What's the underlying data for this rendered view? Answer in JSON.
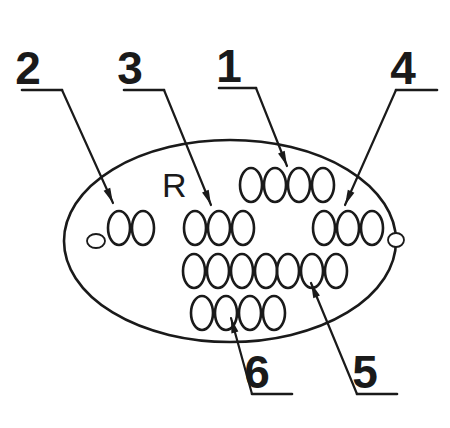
{
  "diagram": {
    "type": "line-drawing",
    "background_color": "#ffffff",
    "stroke_color": "#1a1a1a",
    "plate": {
      "shape": "ellipse",
      "cx": 230,
      "cy": 241,
      "rx": 166,
      "ry": 101,
      "stroke_width": 2.6,
      "mount_holes": [
        {
          "name": "left-mount-hole",
          "cx": 96,
          "cy": 241,
          "rx": 9,
          "ry": 7
        },
        {
          "name": "right-mount-hole",
          "cx": 396,
          "cy": 240,
          "rx": 8,
          "ry": 7
        }
      ]
    },
    "plate_letter": {
      "text": "R",
      "x": 162,
      "y": 197
    },
    "field_rows": [
      {
        "name": "row-1",
        "y": 185,
        "groups": [
          {
            "name": "row1-group-a",
            "chars": "0000",
            "x": 240
          }
        ]
      },
      {
        "name": "row-2",
        "y": 228,
        "groups": [
          {
            "name": "row2-group-a",
            "chars": "00",
            "x": 108
          },
          {
            "name": "row2-group-b",
            "chars": "000",
            "x": 184
          },
          {
            "name": "row2-group-c",
            "chars": "000",
            "x": 313
          }
        ]
      },
      {
        "name": "row-3",
        "y": 271,
        "groups": [
          {
            "name": "row3-group-a",
            "chars": "0000",
            "x": 183
          },
          {
            "name": "row3-group-b",
            "chars": "000",
            "x": 277
          }
        ]
      },
      {
        "name": "row-4",
        "y": 313,
        "groups": [
          {
            "name": "row4-group-a",
            "chars": "0000",
            "x": 191
          }
        ]
      }
    ],
    "field_char_glyph": {
      "glyph": "0",
      "rx": 11,
      "ry": 17,
      "advance": 24,
      "stroke_width": 2.6
    },
    "callouts": [
      {
        "id": "callout-2",
        "label": "2",
        "label_x": 28,
        "label_y": 84,
        "underline": {
          "x1": 22,
          "y1": 90,
          "x2": 62,
          "y2": 90
        },
        "leader": {
          "x1": 62,
          "y1": 90,
          "x2": 113,
          "y2": 203
        },
        "arrow_angle_deg": 66,
        "arrow_x": 113,
        "arrow_y": 203,
        "target": "row2-group-a"
      },
      {
        "id": "callout-3",
        "label": "3",
        "label_x": 130,
        "label_y": 84,
        "underline": {
          "x1": 124,
          "y1": 90,
          "x2": 164,
          "y2": 90
        },
        "leader": {
          "x1": 164,
          "y1": 90,
          "x2": 211,
          "y2": 205
        },
        "arrow_angle_deg": 68,
        "arrow_x": 211,
        "arrow_y": 205,
        "target": "row2-group-b"
      },
      {
        "id": "callout-1",
        "label": "1",
        "label_x": 229,
        "label_y": 82,
        "underline": {
          "x1": 219,
          "y1": 88,
          "x2": 256,
          "y2": 88
        },
        "leader": {
          "x1": 256,
          "y1": 88,
          "x2": 287,
          "y2": 166
        },
        "arrow_angle_deg": 68,
        "arrow_x": 287,
        "arrow_y": 166,
        "target": "row1-group-a"
      },
      {
        "id": "callout-4",
        "label": "4",
        "label_x": 403,
        "label_y": 84,
        "underline": {
          "x1": 396,
          "y1": 90,
          "x2": 437,
          "y2": 90
        },
        "leader": {
          "x1": 396,
          "y1": 90,
          "x2": 345,
          "y2": 205
        },
        "arrow_angle_deg": 114,
        "arrow_x": 345,
        "arrow_y": 205,
        "target": "row2-group-c"
      },
      {
        "id": "callout-6",
        "label": "6",
        "label_x": 257,
        "label_y": 388,
        "underline": {
          "x1": 252,
          "y1": 394,
          "x2": 292,
          "y2": 394
        },
        "leader": {
          "x1": 252,
          "y1": 394,
          "x2": 231,
          "y2": 318
        },
        "arrow_angle_deg": -105,
        "arrow_x": 231,
        "arrow_y": 318,
        "target": "row4-group-a"
      },
      {
        "id": "callout-5",
        "label": "5",
        "label_x": 365,
        "label_y": 388,
        "underline": {
          "x1": 357,
          "y1": 394,
          "x2": 397,
          "y2": 394
        },
        "leader": {
          "x1": 357,
          "y1": 394,
          "x2": 311,
          "y2": 283
        },
        "arrow_angle_deg": -112,
        "arrow_x": 311,
        "arrow_y": 283,
        "target": "row3-group-b"
      }
    ]
  }
}
